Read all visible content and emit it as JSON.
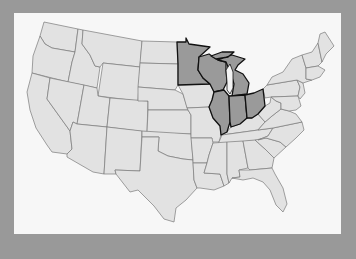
{
  "map": {
    "title": "United States — Midwest (Great Lakes states) highlighted",
    "colors": {
      "background": "#999999",
      "panel": "#f7f7f7",
      "state_fill": "#e2e2e2",
      "state_border": "#7a7a7a",
      "highlight_fill": "#9a9a9a",
      "highlight_border": "#111111"
    },
    "highlighted_states": [
      "Minnesota",
      "Wisconsin",
      "Michigan",
      "Illinois",
      "Indiana",
      "Ohio"
    ],
    "states": [
      {
        "name": "Washington",
        "d": "M44,22 L78,29 L75,52 L52,48 L45,44 L40,36 Z",
        "hl": false
      },
      {
        "name": "Oregon",
        "d": "M40,36 L45,44 L52,48 L75,52 L72,62 L68,82 L32,73 L33,56 Z",
        "hl": false
      },
      {
        "name": "California",
        "d": "M32,73 L50,78 L47,99 L70,131 L72,149 L67,154 L52,152 L47,145 L36,128 L30,110 L27,92 Z",
        "hl": false
      },
      {
        "name": "Idaho",
        "d": "M78,29 L83,30 L82,44 L90,55 L95,66 L100,67 L97,88 L68,82 L72,62 L75,52 Z",
        "hl": false
      },
      {
        "name": "Nevada",
        "d": "M50,78 L84,85 L77,124 L73,122 L70,131 L47,99 Z",
        "hl": false
      },
      {
        "name": "Montana",
        "d": "M83,30 L142,41 L140,67 L103,63 L100,67 L95,66 L90,55 L82,44 Z",
        "hl": false
      },
      {
        "name": "Wyoming",
        "d": "M103,63 L140,67 L138,101 L98,96 Z",
        "hl": false
      },
      {
        "name": "Utah",
        "d": "M84,85 L97,88 L98,96 L110,98 L107,127 L77,124 Z",
        "hl": false
      },
      {
        "name": "Arizona",
        "d": "M77,124 L107,127 L104,174 L93,172 L67,157 L67,154 L72,149 L70,131 L73,122 Z",
        "hl": false
      },
      {
        "name": "Colorado",
        "d": "M110,98 L148,101 L147,132 L107,127 Z",
        "hl": false
      },
      {
        "name": "New Mexico",
        "d": "M107,127 L142,131 L140,171 L115,170 L116,174 L104,174 Z",
        "hl": false
      },
      {
        "name": "North Dakota",
        "d": "M142,41 L177,42 L178,64 L140,63 Z",
        "hl": false
      },
      {
        "name": "South Dakota",
        "d": "M140,63 L178,64 L178,85 L175,90 L138,87 Z",
        "hl": false
      },
      {
        "name": "Nebraska",
        "d": "M138,87 L175,90 L183,94 L188,110 L148,110 L148,101 L138,101 Z",
        "hl": false
      },
      {
        "name": "Kansas",
        "d": "M148,110 L188,110 L191,115 L191,134 L147,133 Z",
        "hl": false
      },
      {
        "name": "Oklahoma",
        "d": "M142,131 L191,134 L193,160 L183,159 L168,156 L158,151 L159,137 L142,137 Z",
        "hl": false
      },
      {
        "name": "Texas",
        "d": "M142,137 L159,137 L158,151 L168,156 L183,159 L193,160 L194,180 L197,188 L186,200 L176,208 L174,222 L164,219 L154,206 L146,198 L138,190 L130,192 L116,174 L115,170 L140,171 Z",
        "hl": false
      },
      {
        "name": "Minnesota",
        "d": "M177,42 L186,42 L186,38 L189,44 L210,47 L199,57 L198,70 L203,78 L210,84 L178,85 L178,64 Z",
        "hl": true
      },
      {
        "name": "Iowa",
        "d": "M178,85 L210,84 L214,92 L212,100 L209,107 L187,108 L183,94 Z",
        "hl": false
      },
      {
        "name": "Missouri",
        "d": "M187,108 L209,107 L213,118 L220,126 L221,135 L219,142 L211,142 L212,138 L191,138 L191,115 L188,110 Z",
        "hl": false
      },
      {
        "name": "Arkansas",
        "d": "M191,138 L212,138 L213,143 L209,155 L207,163 L193,163 L193,160 Z",
        "hl": false
      },
      {
        "name": "Louisiana",
        "d": "M193,163 L207,163 L204,173 L220,174 L224,186 L214,190 L200,188 L197,188 L194,180 Z",
        "hl": false
      },
      {
        "name": "Wisconsin",
        "d": "M199,57 L209,54 L218,60 L226,62 L226,70 L227,82 L223,90 L214,92 L210,84 L203,78 L198,70 Z",
        "hl": true
      },
      {
        "name": "Illinois",
        "d": "M214,92 L224,90 L229,96 L230,122 L227,132 L221,135 L220,126 L213,118 L209,107 L212,100 Z",
        "hl": true
      },
      {
        "name": "Michigan",
        "d": "M218,60 L232,55 L245,59 L238,65 L235,70 L243,74 L249,83 L247,94 L232,96 L234,84 L231,74 L226,62 Z M211,56 L222,52 L234,52 L228,57 L216,59 Z",
        "hl": true
      },
      {
        "name": "Indiana",
        "d": "M229,96 L245,95 L247,118 L240,124 L231,127 L230,122 Z",
        "hl": true
      },
      {
        "name": "Ohio",
        "d": "M245,95 L254,93 L263,89 L265,106 L258,114 L252,118 L247,118 Z",
        "hl": true
      },
      {
        "name": "Kentucky",
        "d": "M221,135 L227,132 L231,127 L240,124 L247,118 L252,118 L258,114 L265,122 L258,130 L222,135 Z",
        "hl": false
      },
      {
        "name": "Tennessee",
        "d": "M219,142 L222,135 L258,130 L273,128 L268,136 L258,140 L216,145 Z",
        "hl": false
      },
      {
        "name": "Mississippi",
        "d": "M213,143 L227,142 L227,174 L229,183 L224,186 L220,174 L204,173 L207,163 L209,155 Z",
        "hl": false
      },
      {
        "name": "Alabama",
        "d": "M227,142 L243,141 L248,168 L239,170 L240,177 L232,178 L229,183 L227,174 Z",
        "hl": false
      },
      {
        "name": "Georgia",
        "d": "M243,141 L255,140 L265,149 L274,158 L272,168 L250,170 L248,168 Z",
        "hl": false
      },
      {
        "name": "Florida",
        "d": "M232,178 L240,177 L239,170 L250,170 L272,168 L275,174 L283,188 L287,204 L283,212 L276,205 L270,190 L263,182 L253,178 L243,180 Z",
        "hl": false
      },
      {
        "name": "South Carolina",
        "d": "M255,140 L266,138 L280,142 L286,147 L274,158 L265,149 Z",
        "hl": false
      },
      {
        "name": "North Carolina",
        "d": "M268,136 L273,128 L302,122 L304,130 L296,138 L286,147 L280,142 L266,138 L258,140 Z",
        "hl": false
      },
      {
        "name": "Virginia",
        "d": "M258,130 L265,122 L272,116 L281,109 L289,111 L296,114 L302,122 L273,128 Z",
        "hl": false
      },
      {
        "name": "West Virginia",
        "d": "M258,114 L265,106 L270,103 L271,97 L276,101 L281,103 L281,109 L272,116 L265,122 Z",
        "hl": false
      },
      {
        "name": "Pennsylvania",
        "d": "M263,89 L267,85 L297,80 L300,87 L298,96 L271,97 L265,98 Z",
        "hl": false
      },
      {
        "name": "Maryland/Delaware",
        "d": "M271,97 L298,96 L301,106 L296,110 L289,111 L281,109 L281,103 L276,101 Z",
        "hl": false
      },
      {
        "name": "New Jersey",
        "d": "M297,80 L303,83 L305,93 L300,99 L298,96 L300,87 Z",
        "hl": false
      },
      {
        "name": "New York",
        "d": "M267,85 L272,77 L283,72 L292,59 L302,55 L306,68 L306,79 L312,80 L303,83 L297,80 Z",
        "hl": false
      },
      {
        "name": "Vermont/New Hampshire",
        "d": "M302,55 L312,52 L318,43 L322,62 L318,66 L306,68 Z",
        "hl": false
      },
      {
        "name": "Massachusetts/CT/RI",
        "d": "M306,68 L318,66 L325,70 L320,77 L312,80 L306,79 Z",
        "hl": false
      },
      {
        "name": "Maine",
        "d": "M318,43 L320,34 L325,32 L334,46 L326,54 L322,62 Z",
        "hl": false
      }
    ],
    "lake_michigan": "M226,70 L230,64 L233,72 L233,88 L230,94 L227,90 L227,82 Z"
  }
}
